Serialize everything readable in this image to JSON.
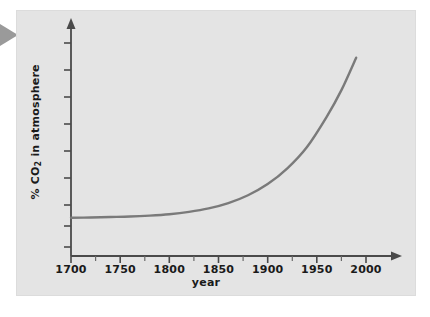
{
  "figure": {
    "pointer_icon": "triangle-right-pointer",
    "panel_color": "#e4e4e4",
    "axis_color": "#4a4a4a",
    "curve_color": "#7a7a7a"
  },
  "chart_data": {
    "type": "line",
    "title": "",
    "xlabel": "year",
    "ylabel": "% CO2 in atmosphere",
    "ylabel_html": "% CO<sub>2</sub> in atmosphere",
    "xlim": [
      1700,
      2000
    ],
    "ylim": [
      0,
      1
    ],
    "grid": false,
    "legend": null,
    "x_tick_labels": [
      "1700",
      "1750",
      "1800",
      "1850",
      "1900",
      "1950",
      "2000"
    ],
    "x_ticks": [
      1700,
      1750,
      1800,
      1850,
      1900,
      1950,
      2000
    ],
    "x_minor_ticks": [
      1725,
      1775,
      1825,
      1875,
      1925,
      1975
    ],
    "y_tick_labels": [],
    "y_ticks_count": 9,
    "axis_style": "arrow-ended",
    "series": [
      {
        "name": "% CO2 in atmosphere",
        "x": [
          1700,
          1720,
          1740,
          1760,
          1780,
          1800,
          1820,
          1840,
          1860,
          1880,
          1900,
          1920,
          1940,
          1960,
          1975,
          1990
        ],
        "values": [
          0.165,
          0.166,
          0.168,
          0.17,
          0.174,
          0.18,
          0.19,
          0.205,
          0.228,
          0.262,
          0.31,
          0.378,
          0.47,
          0.6,
          0.715,
          0.855
        ]
      }
    ],
    "annotation": "Exponential rise in atmospheric CO2 from 1700 to 2000"
  },
  "axes": {
    "x_label": "year",
    "y_label_prefix": "% CO",
    "y_label_sub": "2",
    "y_label_suffix": " in atmosphere"
  }
}
